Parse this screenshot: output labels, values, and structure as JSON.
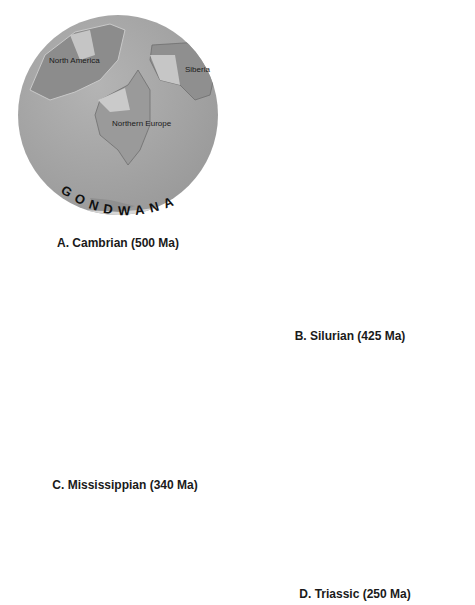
{
  "figure": {
    "panels": [
      {
        "id": "A",
        "caption": "A. Cambrian (500 Ma)",
        "supercontinent_label": "GONDWANA",
        "labels": [
          "North America",
          "Siberia",
          "Northern Europe"
        ]
      },
      {
        "id": "B",
        "caption": "B. Silurian (425 Ma)",
        "supercontinent_label": "GONDWANA",
        "labels": [
          "Siberia",
          "Northern Europe",
          "North America"
        ]
      },
      {
        "id": "C",
        "caption": "C. Mississippian (340 Ma)",
        "supercontinent_label": "GONDWANA",
        "labels": [
          "Siberia",
          "Northern Europe",
          "North America",
          "Africa",
          "South America"
        ]
      },
      {
        "id": "D",
        "caption": "D. Triassic (250 Ma)",
        "supercontinent_label": "PANGAEA",
        "labels": [
          "Eurasia",
          "North America",
          "South America",
          "Africa"
        ]
      }
    ],
    "colors": {
      "ocean": "#a9a9a9",
      "land_light": "#c8c8c8",
      "land_dark": "#8c8c8c",
      "gondwana": "#d9d9d9",
      "arrow": "#b5b5b5"
    }
  }
}
